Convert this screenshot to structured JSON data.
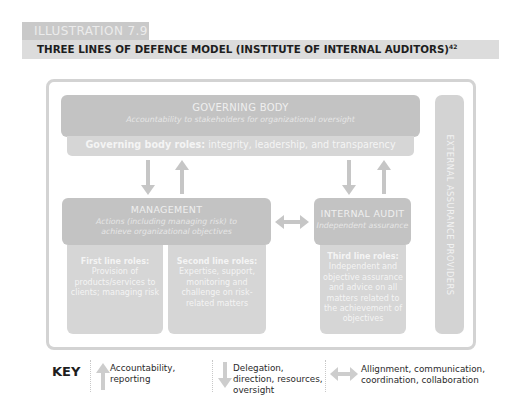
{
  "header": {
    "tab_label": "ILLUSTRATION 7.9",
    "title": "THREE LINES OF DEFENCE MODEL (INSTITUTE OF INTERNAL AUDITORS)",
    "title_superscript": "42"
  },
  "diagram": {
    "governing_body": {
      "title": "GOVERNING BODY",
      "subtitle": "Accountability to stakeholders for organizational oversight",
      "roles_label": "Governing body roles:",
      "roles_text": " integrity, leadership, and transparency"
    },
    "management": {
      "title": "MANAGEMENT",
      "subtitle": "Actions (including managing risk) to achieve organizational objectives"
    },
    "first_line": {
      "label": "First line roles:",
      "text": "Provision of products/services to clients; managing risk"
    },
    "second_line": {
      "label": "Second line roles:",
      "text": "Expertise, support, monitoring and challenge on risk-related matters"
    },
    "internal_audit": {
      "title": "INTERNAL AUDIT",
      "subtitle": "Independent assurance"
    },
    "third_line": {
      "label": "Third line roles:",
      "text": "Independent and objective assurance and advice on all matters related to the achievement of objectives"
    },
    "external": {
      "label": "EXTERNAL ASSURANCE PROVIDERS"
    }
  },
  "key": {
    "label": "KEY",
    "items": [
      {
        "icon": "arrow-up-icon",
        "text": "Accountability, reporting"
      },
      {
        "icon": "arrow-down-icon",
        "text": "Delegation, direction, resources, oversight"
      },
      {
        "icon": "arrow-double-icon",
        "text": "Allignment, communication, coordination, collaboration"
      }
    ]
  },
  "colors": {
    "box_dark": "#c3c3c3",
    "box_light": "#d6d6d6",
    "arrow": "#c6c6c6",
    "frame": "#d3d3d3"
  }
}
